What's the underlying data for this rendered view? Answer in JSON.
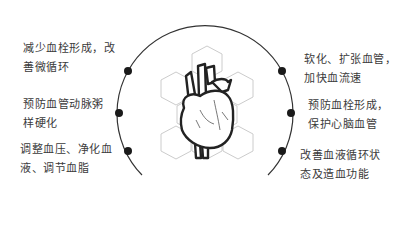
{
  "diagram": {
    "center_icon": "heart-icon",
    "left_items": [
      {
        "line1": "减少血栓形成，改",
        "line2": "善微循环"
      },
      {
        "line1": "预防血管动脉粥",
        "line2": "样硬化"
      },
      {
        "line1": "调整血压、净化血",
        "line2": "液、调节血脂"
      }
    ],
    "right_items": [
      {
        "line1": "软化、扩张血管，",
        "line2": "加快血流速"
      },
      {
        "line1": "预防血栓形成，",
        "line2": "保护心脑血管"
      },
      {
        "line1": "改善血液循环状",
        "line2": "态及造血功能"
      }
    ],
    "colors": {
      "line": "#333333",
      "dot": "#1a1a1a",
      "hex": "#cccccc"
    }
  }
}
